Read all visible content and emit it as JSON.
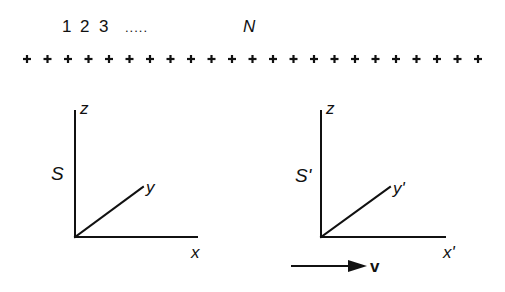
{
  "particles": {
    "index_labels": [
      "1",
      "2",
      "3"
    ],
    "ellipsis": ".....",
    "last_label": "N",
    "count_shown": 23,
    "marker": "plus"
  },
  "frames": [
    {
      "name": "S",
      "axes": {
        "z": "z",
        "x": "x",
        "y": "y"
      }
    },
    {
      "name": "S'",
      "axes": {
        "z": "z",
        "x": "x'",
        "y": "y'"
      }
    }
  ],
  "velocity": {
    "label": "v",
    "direction": "right"
  },
  "colors": {
    "ink": "#111111",
    "background": "#ffffff"
  }
}
